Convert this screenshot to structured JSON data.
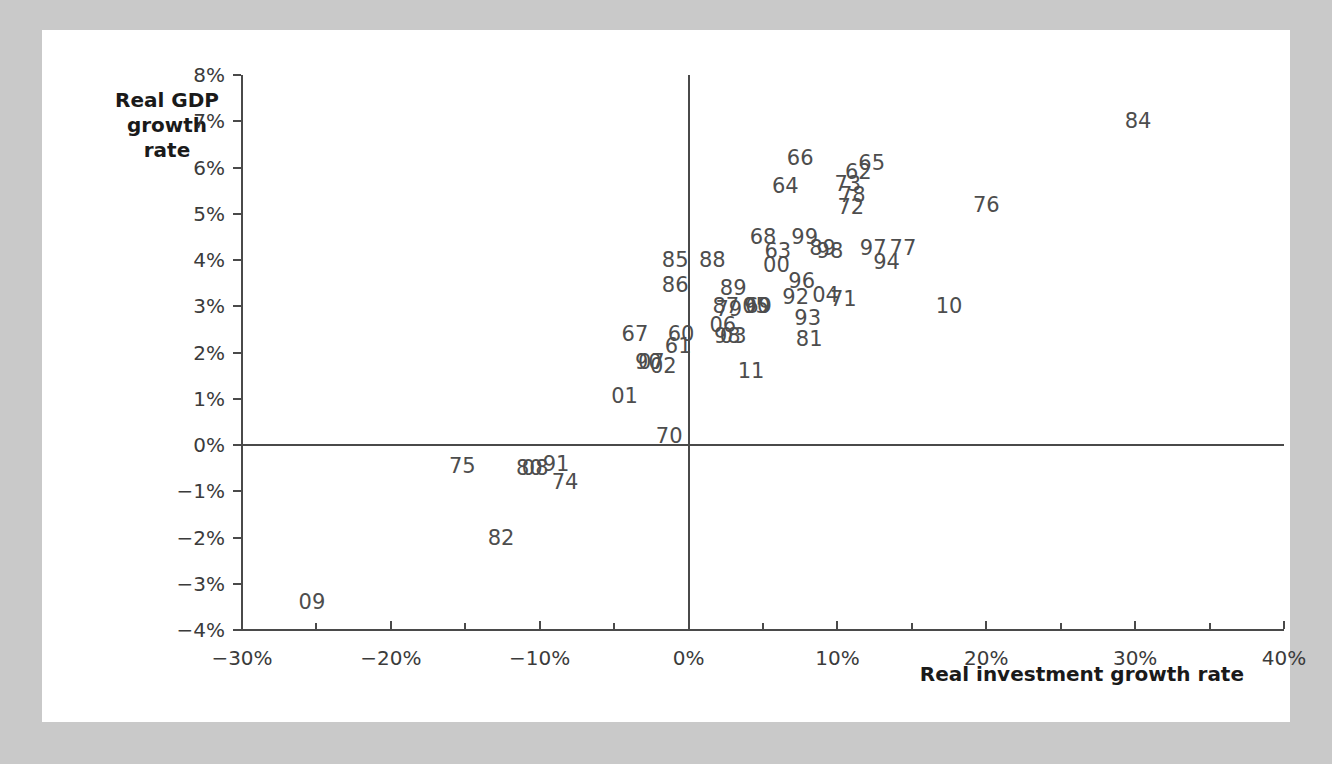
{
  "figure": {
    "background_color": "#c9c9c9",
    "card_color": "#ffffff",
    "axis_color": "#4a4a4a",
    "label_color": "#4d4d4d"
  },
  "chart_data": {
    "type": "scatter",
    "title": "",
    "xlabel": "Real investment growth rate",
    "ylabel": "Real GDP\ngrowth rate",
    "ylabel_line1": "Real GDP",
    "ylabel_line2": "growth rate",
    "xlim": [
      -30,
      40
    ],
    "ylim": [
      -4,
      8
    ],
    "grid": false,
    "legend": "none",
    "x_tick_labels": [
      "-30%",
      "-20%",
      "-10%",
      "0%",
      "10%",
      "20%",
      "30%",
      "40%"
    ],
    "x_tick_values": [
      -30,
      -20,
      -10,
      0,
      10,
      20,
      30,
      40
    ],
    "x_minor_ticks": [
      -25,
      -15,
      -5,
      5,
      15,
      25,
      35
    ],
    "y_tick_labels": [
      "8%",
      "7%",
      "6%",
      "5%",
      "4%",
      "3%",
      "2%",
      "1%",
      "0%",
      "-1%",
      "-2%",
      "-3%",
      "-4%"
    ],
    "y_tick_values": [
      8,
      7,
      6,
      5,
      4,
      3,
      2,
      1,
      0,
      -1,
      -2,
      -3,
      -4
    ],
    "marker_style": "text-label",
    "points": [
      {
        "label": "84",
        "x": 30.2,
        "y": 7.0
      },
      {
        "label": "66",
        "x": 7.5,
        "y": 6.2
      },
      {
        "label": "65",
        "x": 12.3,
        "y": 6.1
      },
      {
        "label": "62",
        "x": 11.4,
        "y": 5.9
      },
      {
        "label": "64",
        "x": 6.5,
        "y": 5.6
      },
      {
        "label": "73",
        "x": 10.7,
        "y": 5.65
      },
      {
        "label": "78",
        "x": 11.0,
        "y": 5.4
      },
      {
        "label": "72",
        "x": 10.9,
        "y": 5.15
      },
      {
        "label": "76",
        "x": 20.0,
        "y": 5.2
      },
      {
        "label": "68",
        "x": 5.0,
        "y": 4.5
      },
      {
        "label": "99",
        "x": 7.8,
        "y": 4.5
      },
      {
        "label": "63",
        "x": 6.0,
        "y": 4.2
      },
      {
        "label": "89",
        "x": 9.0,
        "y": 4.25
      },
      {
        "label": "98",
        "x": 9.5,
        "y": 4.2
      },
      {
        "label": "97",
        "x": 12.4,
        "y": 4.25
      },
      {
        "label": "77",
        "x": 14.4,
        "y": 4.25
      },
      {
        "label": "94",
        "x": 13.3,
        "y": 3.95
      },
      {
        "label": "85",
        "x": -0.9,
        "y": 4.0
      },
      {
        "label": "88",
        "x": 1.6,
        "y": 4.0
      },
      {
        "label": "00",
        "x": 5.9,
        "y": 3.9
      },
      {
        "label": "86",
        "x": -0.9,
        "y": 3.45
      },
      {
        "label": "89",
        "x": 3.0,
        "y": 3.4
      },
      {
        "label": "96",
        "x": 7.6,
        "y": 3.55
      },
      {
        "label": "92",
        "x": 7.2,
        "y": 3.2
      },
      {
        "label": "04",
        "x": 9.2,
        "y": 3.25
      },
      {
        "label": "71",
        "x": 10.4,
        "y": 3.15
      },
      {
        "label": "10",
        "x": 17.5,
        "y": 3.0
      },
      {
        "label": "87",
        "x": 2.5,
        "y": 3.0
      },
      {
        "label": "79",
        "x": 2.7,
        "y": 2.95
      },
      {
        "label": "05",
        "x": 4.5,
        "y": 3.0
      },
      {
        "label": "90",
        "x": 4.6,
        "y": 3.0
      },
      {
        "label": "69",
        "x": 4.7,
        "y": 3.0
      },
      {
        "label": "93",
        "x": 8.0,
        "y": 2.75
      },
      {
        "label": "06",
        "x": 2.3,
        "y": 2.6
      },
      {
        "label": "67",
        "x": -3.6,
        "y": 2.4
      },
      {
        "label": "60",
        "x": -0.5,
        "y": 2.4
      },
      {
        "label": "98",
        "x": 2.6,
        "y": 2.35
      },
      {
        "label": "03",
        "x": 3.0,
        "y": 2.35
      },
      {
        "label": "81",
        "x": 8.1,
        "y": 2.3
      },
      {
        "label": "61",
        "x": -0.7,
        "y": 2.15
      },
      {
        "label": "90",
        "x": -2.7,
        "y": 1.8
      },
      {
        "label": "07",
        "x": -2.5,
        "y": 1.8
      },
      {
        "label": "02",
        "x": -1.7,
        "y": 1.7
      },
      {
        "label": "11",
        "x": 4.2,
        "y": 1.6
      },
      {
        "label": "01",
        "x": -4.3,
        "y": 1.05
      },
      {
        "label": "70",
        "x": -1.3,
        "y": 0.2
      },
      {
        "label": "75",
        "x": -15.2,
        "y": -0.45
      },
      {
        "label": "80",
        "x": -10.7,
        "y": -0.5
      },
      {
        "label": "08",
        "x": -10.3,
        "y": -0.5
      },
      {
        "label": "91",
        "x": -8.9,
        "y": -0.4
      },
      {
        "label": "74",
        "x": -8.3,
        "y": -0.8
      },
      {
        "label": "82",
        "x": -12.6,
        "y": -2.0
      },
      {
        "label": "09",
        "x": -25.3,
        "y": -3.4
      }
    ]
  }
}
